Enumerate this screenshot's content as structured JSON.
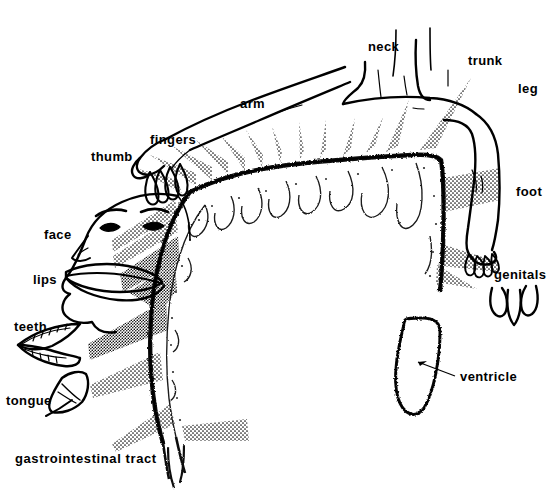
{
  "figure": {
    "kind": "sensory-homunculus-diagram",
    "background_color": "#ffffff",
    "ink_color": "#000000"
  },
  "labels": {
    "neck": "neck",
    "trunk": "trunk",
    "leg": "leg",
    "foot": "foot",
    "genitals": "genitals",
    "arm": "arm",
    "fingers": "fingers",
    "thumb": "thumb",
    "face": "face",
    "lips": "lips",
    "teeth": "teeth",
    "tongue": "tongue",
    "gastrointestinal_tract": "gastrointestinal  tract",
    "ventricle": "ventricle"
  },
  "label_positions": {
    "neck": {
      "x": 368,
      "y": 40
    },
    "trunk": {
      "x": 468,
      "y": 54
    },
    "leg": {
      "x": 518,
      "y": 82
    },
    "foot": {
      "x": 516,
      "y": 185
    },
    "genitals": {
      "x": 494,
      "y": 268
    },
    "arm": {
      "x": 240,
      "y": 97
    },
    "fingers": {
      "x": 150,
      "y": 133
    },
    "thumb": {
      "x": 91,
      "y": 150
    },
    "face": {
      "x": 44,
      "y": 228
    },
    "lips": {
      "x": 33,
      "y": 273
    },
    "teeth": {
      "x": 14,
      "y": 320
    },
    "tongue": {
      "x": 6,
      "y": 394
    },
    "gastrointestinal_tract": {
      "x": 15,
      "y": 452
    },
    "ventricle": {
      "x": 460,
      "y": 370
    }
  },
  "body_parts": [
    "neck",
    "trunk",
    "leg",
    "foot",
    "genitals",
    "arm",
    "fingers",
    "thumb",
    "face",
    "lips",
    "teeth",
    "tongue",
    "gastrointestinal tract"
  ],
  "brain_parts": [
    "cortical strip",
    "ventricle"
  ]
}
